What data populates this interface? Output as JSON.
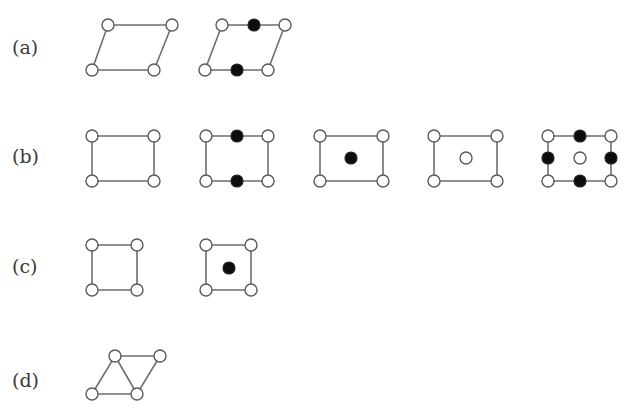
{
  "rows": [
    {
      "id": "a",
      "label": "(a)",
      "label_pos": [
        12,
        38
      ]
    },
    {
      "id": "b",
      "label": "(b)",
      "label_pos": [
        12,
        147
      ]
    },
    {
      "id": "c",
      "label": "(c)",
      "label_pos": [
        12,
        257
      ]
    },
    {
      "id": "d",
      "label": "(d)",
      "label_pos": [
        12,
        371
      ]
    }
  ],
  "style": {
    "edge_color": "#6e6e6e",
    "open_site_fill": "#ffffff",
    "filled_site_fill": "#0d0d0d",
    "site_radius": 6
  },
  "cells": [
    {
      "row": "a",
      "name": "oblique-primitive",
      "polygon": [
        [
          108,
          25
        ],
        [
          172,
          25
        ],
        [
          154,
          70
        ],
        [
          92,
          70
        ]
      ],
      "extra_edges": [],
      "open_sites": [
        [
          108,
          25
        ],
        [
          172,
          25
        ],
        [
          92,
          70
        ],
        [
          154,
          70
        ]
      ],
      "filled_sites": []
    },
    {
      "row": "a",
      "name": "oblique-centered-edges",
      "polygon": [
        [
          222,
          25
        ],
        [
          285,
          25
        ],
        [
          268,
          70
        ],
        [
          205,
          70
        ]
      ],
      "extra_edges": [],
      "open_sites": [
        [
          222,
          25
        ],
        [
          285,
          25
        ],
        [
          205,
          70
        ],
        [
          268,
          70
        ]
      ],
      "filled_sites": [
        [
          254,
          25
        ],
        [
          237,
          70
        ]
      ]
    },
    {
      "row": "b",
      "name": "rectangular-primitive",
      "polygon": [
        [
          92,
          136
        ],
        [
          154,
          136
        ],
        [
          154,
          181
        ],
        [
          92,
          181
        ]
      ],
      "extra_edges": [],
      "open_sites": [
        [
          92,
          136
        ],
        [
          154,
          136
        ],
        [
          92,
          181
        ],
        [
          154,
          181
        ]
      ],
      "filled_sites": []
    },
    {
      "row": "b",
      "name": "rectangular-edge-centered",
      "polygon": [
        [
          206,
          136
        ],
        [
          268,
          136
        ],
        [
          268,
          181
        ],
        [
          206,
          181
        ]
      ],
      "extra_edges": [],
      "open_sites": [
        [
          206,
          136
        ],
        [
          268,
          136
        ],
        [
          206,
          181
        ],
        [
          268,
          181
        ]
      ],
      "filled_sites": [
        [
          237,
          136
        ],
        [
          237,
          181
        ]
      ]
    },
    {
      "row": "b",
      "name": "rectangular-body-centered-filled",
      "polygon": [
        [
          320,
          136
        ],
        [
          383,
          136
        ],
        [
          383,
          181
        ],
        [
          320,
          181
        ]
      ],
      "extra_edges": [],
      "open_sites": [
        [
          320,
          136
        ],
        [
          383,
          136
        ],
        [
          320,
          181
        ],
        [
          383,
          181
        ]
      ],
      "filled_sites": [
        [
          351,
          158
        ]
      ]
    },
    {
      "row": "b",
      "name": "rectangular-body-centered-open",
      "polygon": [
        [
          434,
          136
        ],
        [
          497,
          136
        ],
        [
          497,
          181
        ],
        [
          434,
          181
        ]
      ],
      "extra_edges": [],
      "open_sites": [
        [
          434,
          136
        ],
        [
          497,
          136
        ],
        [
          434,
          181
        ],
        [
          497,
          181
        ],
        [
          466,
          158
        ]
      ],
      "filled_sites": []
    },
    {
      "row": "b",
      "name": "rectangular-face-and-body",
      "polygon": [
        [
          548,
          136
        ],
        [
          611,
          136
        ],
        [
          611,
          181
        ],
        [
          548,
          181
        ]
      ],
      "extra_edges": [],
      "open_sites": [
        [
          548,
          136
        ],
        [
          611,
          136
        ],
        [
          548,
          181
        ],
        [
          611,
          181
        ],
        [
          580,
          158
        ]
      ],
      "filled_sites": [
        [
          580,
          136
        ],
        [
          580,
          181
        ],
        [
          548,
          158
        ],
        [
          611,
          158
        ]
      ]
    },
    {
      "row": "c",
      "name": "square-primitive",
      "polygon": [
        [
          92,
          245
        ],
        [
          137,
          245
        ],
        [
          137,
          290
        ],
        [
          92,
          290
        ]
      ],
      "extra_edges": [],
      "open_sites": [
        [
          92,
          245
        ],
        [
          137,
          245
        ],
        [
          92,
          290
        ],
        [
          137,
          290
        ]
      ],
      "filled_sites": []
    },
    {
      "row": "c",
      "name": "square-centered",
      "polygon": [
        [
          206,
          245
        ],
        [
          251,
          245
        ],
        [
          251,
          290
        ],
        [
          206,
          290
        ]
      ],
      "extra_edges": [],
      "open_sites": [
        [
          206,
          245
        ],
        [
          251,
          245
        ],
        [
          206,
          290
        ],
        [
          251,
          290
        ]
      ],
      "filled_sites": [
        [
          229,
          268
        ]
      ]
    },
    {
      "row": "d",
      "name": "hexagonal-rhombus",
      "polygon": [
        [
          115,
          356
        ],
        [
          160,
          356
        ],
        [
          137,
          394
        ],
        [
          92,
          394
        ]
      ],
      "extra_edges": [
        [
          [
            115,
            356
          ],
          [
            137,
            394
          ]
        ]
      ],
      "open_sites": [
        [
          115,
          356
        ],
        [
          160,
          356
        ],
        [
          92,
          394
        ],
        [
          137,
          394
        ]
      ],
      "filled_sites": []
    }
  ]
}
